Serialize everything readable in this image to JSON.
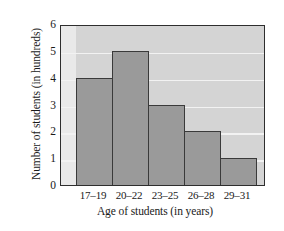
{
  "chart_data": {
    "type": "bar",
    "title": "",
    "categories": [
      "17–19",
      "20–22",
      "23–25",
      "26–28",
      "29–31"
    ],
    "values": [
      4,
      5,
      3,
      2,
      1
    ],
    "xlabel": "Age of students (in years)",
    "ylabel": "Number of students (in hundreds)",
    "ylim": [
      0,
      6
    ],
    "yticks": [
      0,
      1,
      2,
      3,
      4,
      5,
      6
    ],
    "ytick_labels": [
      "0",
      "1",
      "2",
      "3",
      "4",
      "5",
      "6"
    ],
    "gridlines": true,
    "gridline_values": [
      1,
      2,
      3,
      4,
      5
    ],
    "legend": null,
    "colors": {
      "bar_fill": "#9a9a9a",
      "bar_edge": "#3a3a3a",
      "plot_background": "#d4d4d4",
      "gridline": "#f2f2f2",
      "frame": "#2e2e2e",
      "page_background": "#ffffff",
      "text": "#1a1a1a"
    }
  }
}
